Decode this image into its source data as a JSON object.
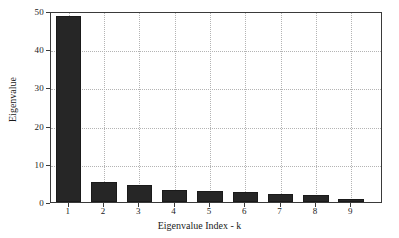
{
  "chart_data": {
    "type": "bar",
    "title": "",
    "xlabel": "Eigenvalue Index - k",
    "ylabel": "Eigenvalue",
    "categories": [
      "1",
      "2",
      "3",
      "4",
      "5",
      "6",
      "7",
      "8",
      "9"
    ],
    "values": [
      48.8,
      5.2,
      4.4,
      3.1,
      2.9,
      2.6,
      2.1,
      1.8,
      0.8
    ],
    "series": [
      {
        "name": "Eigenvalue",
        "values": [
          48.8,
          5.2,
          4.4,
          3.1,
          2.9,
          2.6,
          2.1,
          1.8,
          0.8
        ]
      }
    ],
    "xlim": [
      0.5,
      9.9
    ],
    "ylim": [
      0,
      50
    ],
    "yticks": [
      0,
      10,
      20,
      30,
      40,
      50
    ],
    "ytick_labels": [
      "0",
      "10",
      "20",
      "30",
      "40",
      "50"
    ],
    "xticks": [
      1,
      2,
      3,
      4,
      5,
      6,
      7,
      8,
      9
    ],
    "xtick_labels": [
      "1",
      "2",
      "3",
      "4",
      "5",
      "6",
      "7",
      "8",
      "9"
    ],
    "grid": true,
    "grid_style": "dotted",
    "legend": null,
    "bar_color": "#262626",
    "bar_edge_color": "#1a1a1a",
    "grid_color": "#b4b4b4",
    "axis_color": "#3a3a3a",
    "background_color": "#ffffff",
    "bar_width_fraction": 0.72
  }
}
